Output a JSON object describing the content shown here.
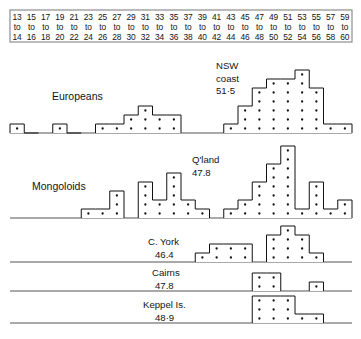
{
  "chart_data": {
    "type": "bar",
    "title": "",
    "xlabel": "",
    "ylabel": "",
    "grid": false,
    "legend": "none",
    "categories": [
      "13 to 14",
      "15 to 16",
      "17 to 18",
      "19 to 20",
      "21 to 22",
      "23 to 24",
      "25 to 26",
      "27 to 28",
      "29 to 30",
      "31 to 32",
      "33 to 34",
      "35 to 36",
      "37 to 38",
      "39 to 40",
      "41 to 42",
      "43 to 44",
      "45 to 46",
      "47 to 48",
      "49 to 50",
      "51 to 52",
      "53 to 54",
      "55 to 56",
      "57 to 58",
      "59 to 60"
    ],
    "category_tops": [
      "13",
      "15",
      "17",
      "19",
      "21",
      "23",
      "25",
      "27",
      "29",
      "31",
      "33",
      "35",
      "37",
      "39",
      "41",
      "43",
      "45",
      "47",
      "49",
      "51",
      "53",
      "55",
      "57",
      "59"
    ],
    "category_mids": [
      "to",
      "to",
      "to",
      "to",
      "to",
      "to",
      "to",
      "to",
      "to",
      "to",
      "to",
      "to",
      "to",
      "to",
      "to",
      "to",
      "to",
      "to",
      "to",
      "to",
      "to",
      "to",
      "to",
      "to"
    ],
    "category_bottoms": [
      "14",
      "16",
      "18",
      "20",
      "22",
      "24",
      "26",
      "28",
      "30",
      "32",
      "34",
      "36",
      "38",
      "40",
      "42",
      "44",
      "46",
      "48",
      "50",
      "52",
      "54",
      "56",
      "58",
      "60"
    ],
    "series": [
      {
        "name": "Europeans",
        "group": "Europeans",
        "annotation": "",
        "values": [
          1,
          0,
          1,
          0,
          1,
          1,
          1,
          2,
          3,
          2,
          2,
          0,
          0,
          0,
          0,
          1,
          3,
          5,
          6,
          6,
          7,
          5,
          1,
          1
        ]
      },
      {
        "name": "NSW coast",
        "group": "Europeans",
        "annotation": "51·5",
        "mean": "51·5",
        "values": [
          0,
          0,
          0,
          0,
          0,
          0,
          0,
          0,
          0,
          0,
          0,
          0,
          0,
          0,
          0,
          0,
          0,
          0,
          0,
          0,
          0,
          0,
          0,
          0
        ]
      },
      {
        "name": "Mongoloids",
        "group": "Mongoloids",
        "annotation": "",
        "values": [
          0,
          0,
          0,
          1,
          1,
          1,
          3,
          0,
          0,
          4,
          2,
          5,
          2,
          1,
          1,
          1,
          2,
          4,
          6,
          8,
          1,
          4,
          1,
          2
        ]
      },
      {
        "name": "Q'land",
        "group": "Mongoloids",
        "annotation": "47.8",
        "mean": "47.8",
        "values": [
          0,
          0,
          0,
          0,
          0,
          0,
          0,
          0,
          0,
          0,
          0,
          0,
          0,
          0,
          0,
          0,
          0,
          0,
          0,
          0,
          0,
          0,
          0,
          0
        ]
      },
      {
        "name": "C. York",
        "group": "sites",
        "annotation": "46.4",
        "mean": "46.4",
        "values": [
          0,
          0,
          0,
          0,
          0,
          0,
          0,
          0,
          0,
          0,
          0,
          0,
          1,
          2,
          2,
          2,
          0,
          3,
          4,
          3,
          1,
          0,
          0,
          0
        ]
      },
      {
        "name": "Cairns",
        "group": "sites",
        "annotation": "47.8",
        "mean": "47.8",
        "values": [
          0,
          0,
          0,
          0,
          0,
          0,
          0,
          0,
          0,
          0,
          0,
          0,
          0,
          0,
          0,
          0,
          2,
          2,
          0,
          0,
          0,
          1,
          0,
          0
        ]
      },
      {
        "name": "Keppel Is.",
        "group": "sites",
        "annotation": "48·9",
        "mean": "48·9",
        "values": [
          0,
          0,
          0,
          0,
          0,
          0,
          0,
          0,
          0,
          0,
          0,
          0,
          0,
          0,
          0,
          0,
          3,
          3,
          3,
          1,
          1,
          0,
          0,
          0
        ]
      }
    ],
    "rows": [
      {
        "id": "europeans",
        "label": "Europeans",
        "label_x": 52,
        "label_y": 100,
        "baseline_y": 133,
        "unit": 9.0,
        "annotation_lines": [
          "NSW",
          "coast",
          "51·5"
        ],
        "annotation_x": 216,
        "annotation_y": 69,
        "segments": [
          {
            "start": 0,
            "values": [
              1,
              0
            ]
          },
          {
            "start": 3,
            "values": [
              1,
              0
            ]
          },
          {
            "start": 6,
            "values": [
              1,
              1,
              2,
              3,
              2,
              2
            ]
          },
          {
            "start": 15,
            "values": [
              1,
              3,
              5,
              6,
              6,
              7,
              5,
              1,
              1
            ]
          }
        ]
      },
      {
        "id": "mongoloids",
        "label": "Mongoloids",
        "label_x": 32,
        "label_y": 190,
        "baseline_y": 218,
        "unit": 9.0,
        "annotation_lines": [
          "Q'land",
          "47.8"
        ],
        "annotation_x": 192,
        "annotation_y": 163,
        "segments": [
          {
            "start": 5,
            "values": [
              1,
              1,
              3
            ]
          },
          {
            "start": 9,
            "values": [
              4,
              2,
              5,
              2,
              1
            ]
          },
          {
            "start": 15,
            "values": [
              1,
              2,
              4,
              6,
              8,
              1,
              4,
              1,
              2
            ]
          }
        ]
      },
      {
        "id": "cyork",
        "label": "C. York",
        "mean": "46.4",
        "label_x": 148,
        "label_y": 245,
        "mean_x": 155,
        "mean_y": 258,
        "baseline_y": 262,
        "unit": 9.0,
        "segments": [
          {
            "start": 13,
            "values": [
              1,
              2,
              2,
              2
            ]
          },
          {
            "start": 18,
            "values": [
              3,
              4,
              3,
              1
            ]
          }
        ]
      },
      {
        "id": "cairns",
        "label": "Cairns",
        "mean": "47.8",
        "label_x": 152,
        "label_y": 276,
        "mean_x": 155,
        "mean_y": 289,
        "baseline_y": 291,
        "unit": 9.0,
        "segments": [
          {
            "start": 17,
            "values": [
              2,
              2
            ]
          },
          {
            "start": 21,
            "values": [
              1
            ]
          }
        ]
      },
      {
        "id": "keppel",
        "label": "Keppel Is.",
        "mean": "48·9",
        "label_x": 143,
        "label_y": 308,
        "mean_x": 155,
        "mean_y": 321,
        "baseline_y": 323,
        "unit": 9.0,
        "segments": [
          {
            "start": 17,
            "values": [
              3,
              3,
              3,
              1,
              1
            ]
          }
        ]
      }
    ],
    "axis": {
      "x_left": 10,
      "x_right": 352,
      "bin_count": 24,
      "bin_width": 14.25
    },
    "ylim": [
      0,
      8
    ]
  },
  "header": {
    "box": {
      "x": 10,
      "y": 10,
      "width": 342,
      "height": 32
    }
  },
  "colors": {
    "ink": "#111111",
    "baseline": "#555555",
    "header_border": "#8e8e8e",
    "background": "#ffffff"
  }
}
